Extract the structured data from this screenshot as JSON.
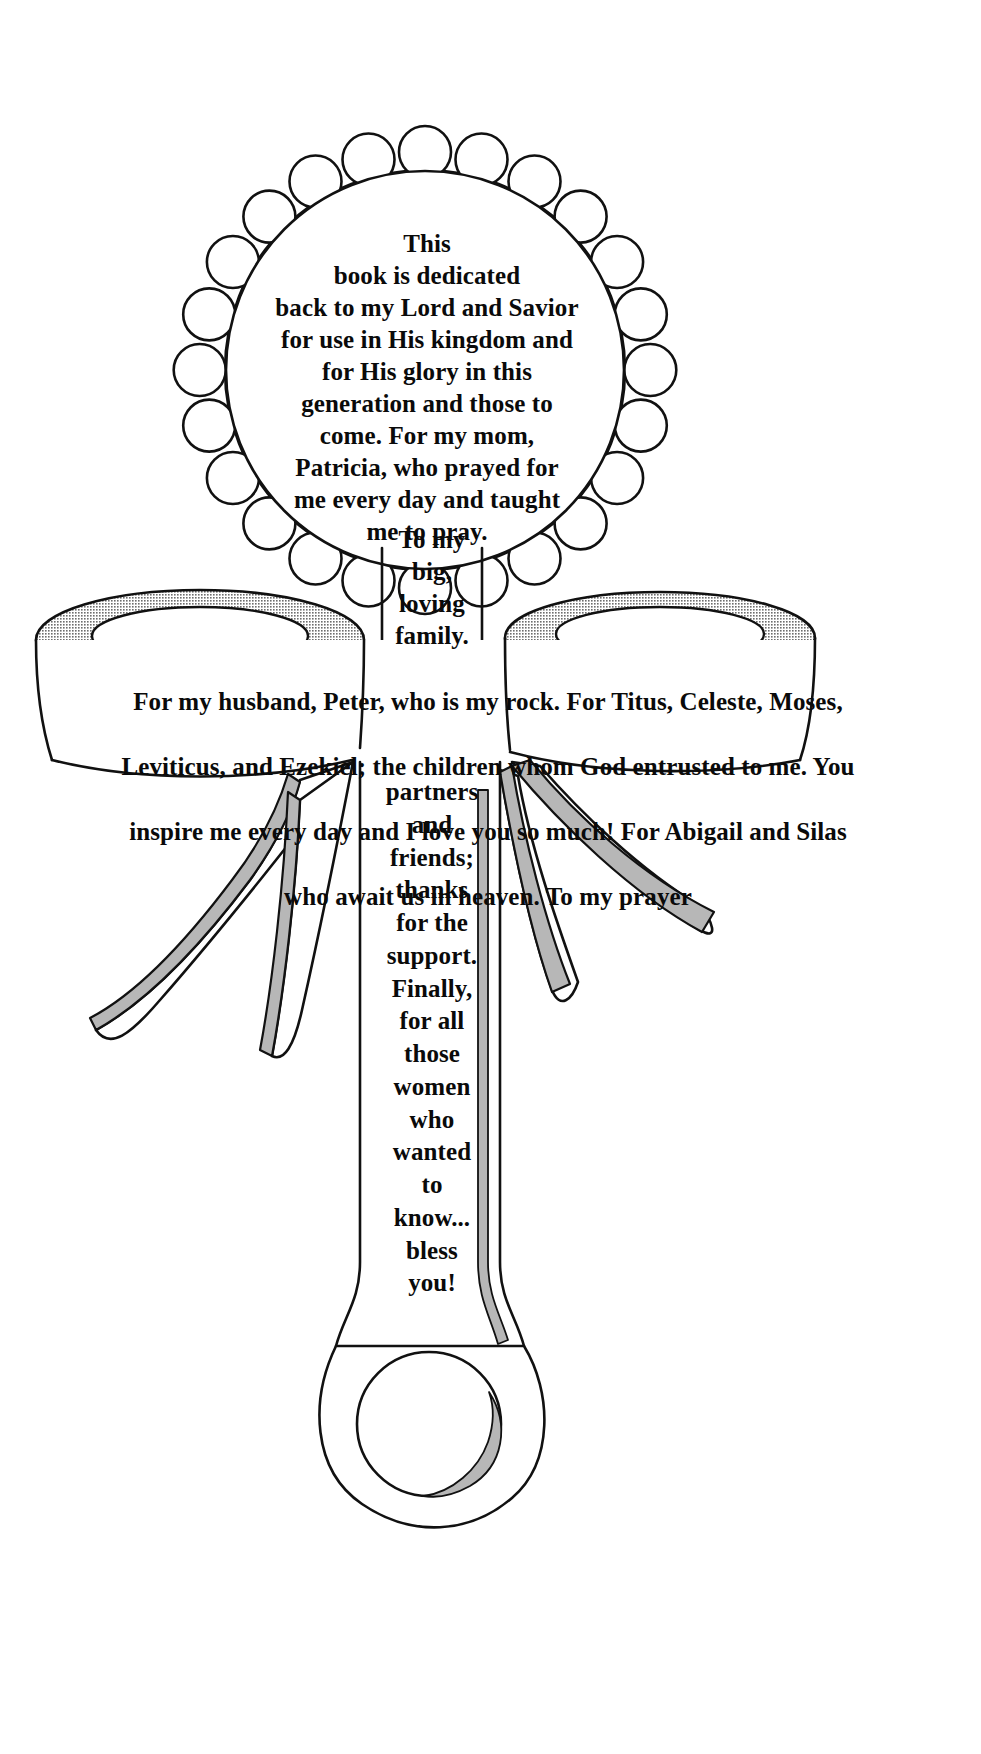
{
  "document": {
    "kind": "book-dedication-page",
    "illustration": "baby-rattle-line-drawing",
    "colors": {
      "ink": "#0a0a0a",
      "paper": "#ffffff",
      "shading": "#9a9a9a",
      "shading_light": "#b5b5b5"
    }
  },
  "dedication": {
    "head": "This\nbook is dedicated\nback to my Lord and Savior\nfor use in His kingdom and\nfor His glory in this\ngeneration and those to\ncome. For my mom,\nPatricia, who prayed for\nme every day and taught\nme to pray.",
    "neck": "To my\nbig,\nloving\nfamily.",
    "band": [
      "For my husband, Peter, who is my rock.  For Titus, Celeste, Moses,",
      "Leviticus, and Ezekiel; the children whom God entrusted to me.  You",
      "inspire me every day and I love you so much!  For Abigail and Silas",
      "who await us in                heaven.                To my prayer"
    ],
    "handle": "partners\nand\nfriends;\nthanks\nfor the\nsupport.\nFinally,\nfor all\nthose\nwomen\nwho\nwanted\nto\nknow...\nbless\nyou!"
  },
  "illustration_parts": {
    "head": "scalloped-rattle-head",
    "neck": "rattle-neck",
    "left_ring": "left-loop-ring",
    "right_ring": "right-loop-ring",
    "left_ribbon": "left-ribbon-streamer",
    "right_ribbon": "right-ribbon-streamer",
    "handle": "rattle-handle",
    "bottom_ring": "bottom-teething-ring"
  }
}
